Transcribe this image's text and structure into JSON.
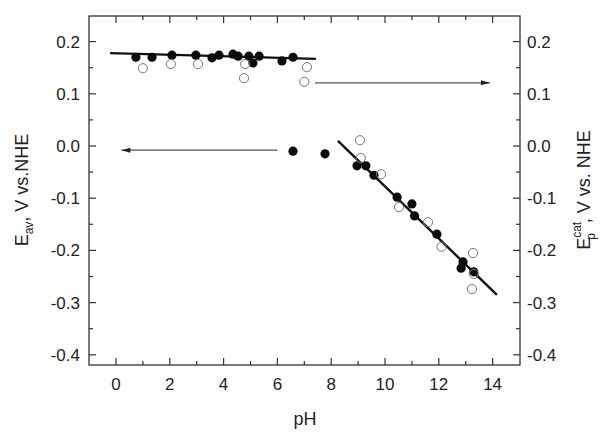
{
  "chart_data": {
    "type": "scatter",
    "title": "",
    "xlabel": "pH",
    "ylabel_left": {
      "main": "E",
      "sub": "av",
      "rest": ", V vs.NHE"
    },
    "ylabel_right": {
      "main": "E",
      "sup": "cat",
      "sub": "p",
      "rest": ", V vs. NHE"
    },
    "xlim": [
      -1,
      15
    ],
    "ylim": [
      -0.42,
      0.25
    ],
    "x_ticks_major": [
      0,
      2,
      4,
      6,
      8,
      10,
      12,
      14
    ],
    "x_ticks_minor": [
      1,
      3,
      5,
      7,
      9,
      11,
      13
    ],
    "y_ticks_major": [
      0.2,
      0.1,
      0.0,
      -0.1,
      -0.2,
      -0.3,
      -0.4
    ],
    "y_tick_labels": [
      "0.2",
      "0.1",
      "0.0",
      "-0.1",
      "-0.2",
      "-0.3",
      "-0.4"
    ],
    "y_ticks_minor": [
      0.15,
      0.05,
      -0.05,
      -0.15,
      -0.25,
      -0.35
    ],
    "grid": false,
    "legend": null,
    "series": [
      {
        "name": "E_av (filled circles, left axis)",
        "marker": "filled-circle",
        "axis": "left",
        "points": [
          [
            0.74,
            0.17
          ],
          [
            1.34,
            0.17
          ],
          [
            2.08,
            0.174
          ],
          [
            2.97,
            0.174
          ],
          [
            3.57,
            0.169
          ],
          [
            3.83,
            0.174
          ],
          [
            4.35,
            0.176
          ],
          [
            4.54,
            0.172
          ],
          [
            4.94,
            0.172
          ],
          [
            5.09,
            0.159
          ],
          [
            5.32,
            0.172
          ],
          [
            6.17,
            0.163
          ],
          [
            6.58,
            0.17
          ],
          [
            6.58,
            -0.01
          ],
          [
            7.77,
            -0.015
          ],
          [
            8.96,
            -0.038
          ],
          [
            9.29,
            -0.038
          ],
          [
            9.59,
            -0.056
          ],
          [
            10.45,
            -0.098
          ],
          [
            11.0,
            -0.111
          ],
          [
            11.1,
            -0.134
          ],
          [
            11.93,
            -0.169
          ],
          [
            12.83,
            -0.234
          ],
          [
            12.9,
            -0.222
          ],
          [
            13.3,
            -0.241
          ]
        ]
      },
      {
        "name": "E_p^cat (open circles, right axis)",
        "marker": "open-circle",
        "axis": "right",
        "points": [
          [
            1.0,
            0.149
          ],
          [
            2.04,
            0.157
          ],
          [
            3.05,
            0.157
          ],
          [
            4.8,
            0.157
          ],
          [
            4.76,
            0.13
          ],
          [
            7.1,
            0.151
          ],
          [
            7.0,
            0.123
          ],
          [
            9.07,
            0.011
          ],
          [
            9.1,
            -0.023
          ],
          [
            9.85,
            -0.054
          ],
          [
            10.52,
            -0.117
          ],
          [
            11.6,
            -0.146
          ],
          [
            12.1,
            -0.193
          ],
          [
            13.27,
            -0.205
          ],
          [
            13.3,
            -0.245
          ],
          [
            13.23,
            -0.274
          ]
        ]
      }
    ],
    "fit_lines": [
      {
        "name": "low-pH plateau fit",
        "from": [
          -0.22,
          0.178
        ],
        "to": [
          7.43,
          0.167
        ]
      },
      {
        "name": "high-pH linear fit",
        "from": [
          8.25,
          0.01
        ],
        "to": [
          14.16,
          -0.285
        ]
      }
    ],
    "annotations": [
      {
        "type": "arrow",
        "meaning": "points to left axis",
        "from": [
          6.0,
          -0.008
        ],
        "to": [
          0.2,
          -0.008
        ]
      },
      {
        "type": "arrow",
        "meaning": "points to right axis",
        "from": [
          7.4,
          0.121
        ],
        "to": [
          13.9,
          0.121
        ]
      }
    ]
  }
}
